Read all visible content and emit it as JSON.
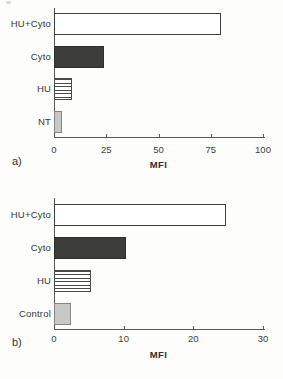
{
  "figure": {
    "background": "#fdfdfc",
    "axis_color": "#5a5a58",
    "text_color": "#363634"
  },
  "chart_data": [
    {
      "type": "bar",
      "orientation": "horizontal",
      "panel_label": "a)",
      "title": "",
      "xlabel": "MFI",
      "categories": [
        "HU+Cyto",
        "Cyto",
        "HU",
        "NT"
      ],
      "values": [
        80,
        24,
        8.5,
        4
      ],
      "xlim": [
        0,
        100
      ],
      "ticks": [
        0,
        25,
        50,
        75,
        100
      ],
      "grid": false,
      "legend": "none",
      "bar_styles": [
        {
          "name": "outlined-white",
          "fill": "#ffffff",
          "border": "#3f3f3d",
          "pattern": "none"
        },
        {
          "name": "solid-dark-gray",
          "fill": "#3d3d3b",
          "border": "#2e2e2c",
          "pattern": "none"
        },
        {
          "name": "horizontal-stripes",
          "fill": "#ffffff",
          "border": "#4a4a48",
          "pattern": "hlines",
          "stripe_color": "#4a4a48"
        },
        {
          "name": "solid-light-gray",
          "fill": "#c8c8c6",
          "border": "#858583",
          "pattern": "none"
        }
      ]
    },
    {
      "type": "bar",
      "orientation": "horizontal",
      "panel_label": "b)",
      "title": "",
      "xlabel": "MFI",
      "categories": [
        "HU+Cyto",
        "Cyto",
        "HU",
        "Control"
      ],
      "values": [
        24.7,
        10.3,
        5.3,
        2.4
      ],
      "xlim": [
        0,
        30
      ],
      "ticks": [
        0,
        10,
        20,
        30
      ],
      "grid": false,
      "legend": "none",
      "bar_styles": [
        {
          "name": "outlined-white",
          "fill": "#ffffff",
          "border": "#3f3f3d",
          "pattern": "none"
        },
        {
          "name": "solid-dark-gray",
          "fill": "#3d3d3b",
          "border": "#2e2e2c",
          "pattern": "none"
        },
        {
          "name": "horizontal-stripes",
          "fill": "#ffffff",
          "border": "#4a4a48",
          "pattern": "hlines",
          "stripe_color": "#4a4a48"
        },
        {
          "name": "solid-light-gray",
          "fill": "#c8c8c6",
          "border": "#858583",
          "pattern": "none"
        }
      ]
    }
  ]
}
